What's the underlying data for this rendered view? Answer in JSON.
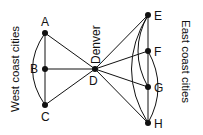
{
  "diagram": {
    "west_label": "West coast cities",
    "east_label": "East coast cities",
    "hub_label": "Denver",
    "nodes": [
      {
        "id": "A",
        "label": "A",
        "x": 45,
        "y": 33
      },
      {
        "id": "B",
        "label": "B",
        "x": 45,
        "y": 69
      },
      {
        "id": "C",
        "label": "C",
        "x": 45,
        "y": 105
      },
      {
        "id": "D",
        "label": "D",
        "x": 95,
        "y": 69
      },
      {
        "id": "E",
        "label": "E",
        "x": 148,
        "y": 15
      },
      {
        "id": "F",
        "label": "F",
        "x": 148,
        "y": 51
      },
      {
        "id": "G",
        "label": "G",
        "x": 148,
        "y": 87
      },
      {
        "id": "H",
        "label": "H",
        "x": 148,
        "y": 123
      }
    ],
    "edges": [
      [
        "A",
        "B"
      ],
      [
        "B",
        "C"
      ],
      [
        "A",
        "C"
      ],
      [
        "A",
        "D"
      ],
      [
        "B",
        "D"
      ],
      [
        "C",
        "D"
      ],
      [
        "D",
        "E"
      ],
      [
        "D",
        "F"
      ],
      [
        "D",
        "G"
      ],
      [
        "D",
        "H"
      ],
      [
        "E",
        "F"
      ],
      [
        "F",
        "G"
      ],
      [
        "G",
        "H"
      ],
      [
        "E",
        "G"
      ],
      [
        "E",
        "H"
      ],
      [
        "F",
        "H"
      ]
    ]
  }
}
